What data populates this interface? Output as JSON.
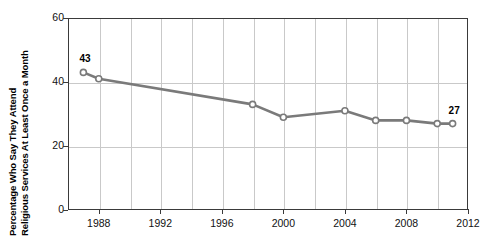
{
  "chart_data": {
    "type": "line",
    "title": "",
    "xlabel": "",
    "ylabel": "Percentage Who Say They Attend Religious Services At Least Once a Month",
    "ylabel_line1": "Percentage Who Say They Attend",
    "ylabel_line2": "Religious Services At Least Once a Month",
    "xlim": [
      1986,
      2012
    ],
    "ylim": [
      0,
      60
    ],
    "yticks": [
      0,
      20,
      40,
      60
    ],
    "ytick_labels": [
      "0",
      "20",
      "40",
      "60"
    ],
    "xticks": [
      1988,
      1992,
      1996,
      2000,
      2004,
      2008,
      2012
    ],
    "xtick_labels": [
      "1988",
      "1992",
      "1996",
      "2000",
      "2004",
      "2008",
      "2012"
    ],
    "grid": true,
    "grid_x_interval": 2,
    "legend": "none",
    "series": [
      {
        "name": "Attend religious services at least once a month",
        "color": "#7a7a7a",
        "marker": "open-circle",
        "x": [
          1987,
          1988,
          1998,
          2000,
          2004,
          2006,
          2008,
          2010,
          2011
        ],
        "values": [
          43,
          41,
          33,
          29,
          31,
          28,
          28,
          27,
          27
        ]
      }
    ],
    "annotations": [
      {
        "text": "43",
        "x": 1987,
        "y": 43,
        "position": "above-left"
      },
      {
        "text": "27",
        "x": 2011,
        "y": 27,
        "position": "above-left"
      }
    ]
  }
}
